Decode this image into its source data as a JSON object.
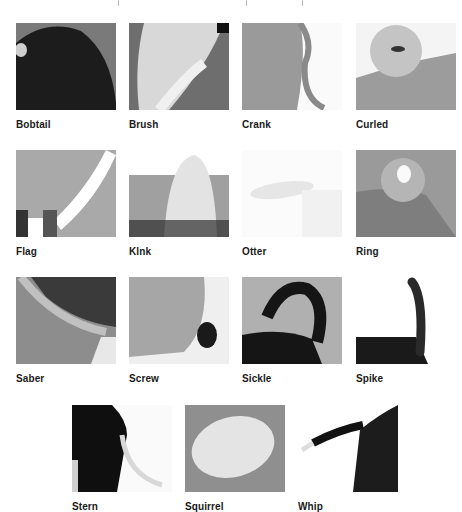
{
  "figure": {
    "rows": [
      [
        "Bobtail",
        "Brush",
        "Crank",
        "Curled"
      ],
      [
        "Flag",
        "Klnk",
        "Otter",
        "Ring"
      ],
      [
        "Saber",
        "Screw",
        "Sickle",
        "Spike"
      ],
      [
        "Stern",
        "Squirrel",
        "Whip"
      ]
    ]
  },
  "tiles": [
    {
      "label": "Bobtail",
      "photo": "dark-furry-rump"
    },
    {
      "label": "Brush",
      "photo": "light-bushy-tail"
    },
    {
      "label": "Crank",
      "photo": "thin-hanging-tail"
    },
    {
      "label": "Curled",
      "photo": "fluffy-curled-tail"
    },
    {
      "label": "Flag",
      "photo": "white-raised-tail"
    },
    {
      "label": "Klnk",
      "photo": "long-haired-bent-tail"
    },
    {
      "label": "Otter",
      "photo": "faded-thick-tail"
    },
    {
      "label": "Ring",
      "photo": "ring-curled-tail"
    },
    {
      "label": "Saber",
      "photo": "curved-low-tail"
    },
    {
      "label": "Screw",
      "photo": "short-twisted-tail"
    },
    {
      "label": "Sickle",
      "photo": "black-sickle-tail"
    },
    {
      "label": "Spike",
      "photo": "upright-black-tail"
    },
    {
      "label": "Stern",
      "photo": "black-dog-white-tail"
    },
    {
      "label": "Squirrel",
      "photo": "white-fluffy-tail"
    },
    {
      "label": "Whip",
      "photo": "black-whip-tail"
    }
  ]
}
